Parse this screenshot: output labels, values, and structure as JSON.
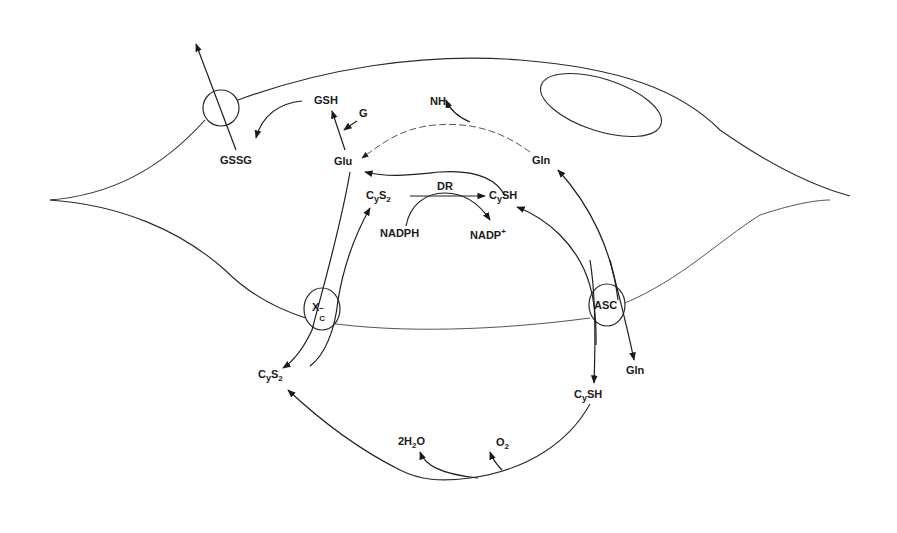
{
  "diagram": {
    "type": "cell metabolic pathway diagram",
    "transporters": {
      "gssg_efflux": "",
      "xc": {
        "main": "X",
        "sup": "−",
        "sub": "C"
      },
      "asc": "ASC"
    },
    "labels": {
      "gsh": "GSH",
      "g": "G",
      "gssg": "GSSG",
      "glu": "Glu",
      "nh3": {
        "main": "NH",
        "sub": "3"
      },
      "gln_inside": "Gln",
      "cys2_inside": {
        "c": "C",
        "y": "y",
        "s": "S",
        "sub": "2"
      },
      "dr": "DR",
      "cysh_inside": {
        "c": "C",
        "y": "y",
        "rest": "SH"
      },
      "nadph": "NADPH",
      "nadp": {
        "main": "NADP",
        "sup": "+"
      },
      "cys2_outside": {
        "c": "C",
        "y": "y",
        "s": "S",
        "sub": "2"
      },
      "cysh_outside": {
        "c": "C",
        "y": "y",
        "rest": "SH"
      },
      "gln_outside": "Gln",
      "h2o": {
        "pre": "2H",
        "sub": "2",
        "post": "O"
      },
      "o2": {
        "main": "O",
        "sub": "2"
      }
    },
    "colors": {
      "stroke": "#2a2a2a",
      "text": "#1a1a1a",
      "background": "#ffffff"
    }
  }
}
